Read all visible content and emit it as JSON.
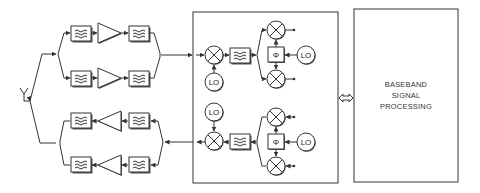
{
  "diagram": {
    "title": "",
    "baseband_block": {
      "lines": [
        "BASEBAND",
        "SIGNAL",
        "PROCESSING"
      ]
    },
    "lo_label": "LO",
    "phase_label": "Φ",
    "components": {
      "antenna": "antenna-icon",
      "filter": "bandpass-filter-icon",
      "amplifier": "amplifier-icon",
      "mixer": "mixer-icon",
      "oscillator": "local-oscillator",
      "phase_shifter": "phase-shifter",
      "bus": "bidirectional-bus-arrow"
    },
    "sections": {
      "receive_paths": 2,
      "transmit_paths": 2,
      "transceiver_block": "RF/IF transceiver",
      "baseband_block": "Baseband signal processing"
    }
  }
}
